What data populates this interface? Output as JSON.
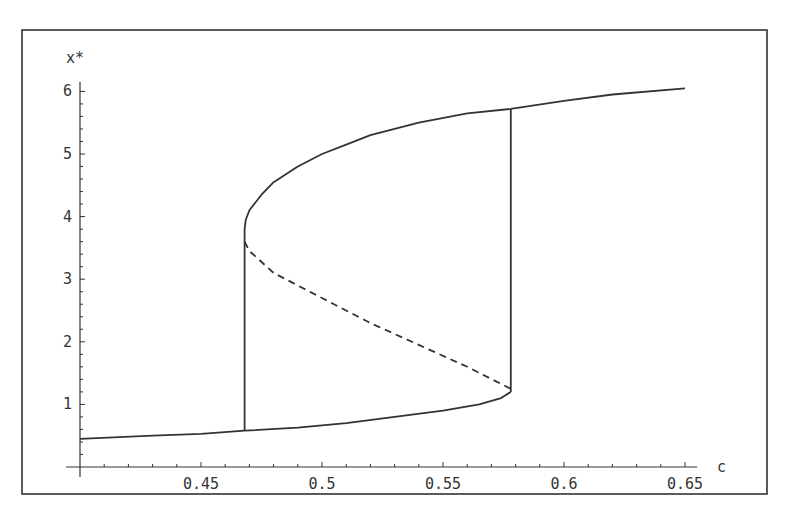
{
  "chart_data": {
    "type": "line",
    "title": "",
    "xlabel": "c",
    "ylabel": "x*",
    "xlim": [
      0.4,
      0.655
    ],
    "ylim": [
      0,
      6.2
    ],
    "grid": false,
    "legend": null,
    "x_ticks": [
      0.45,
      0.5,
      0.55,
      0.6,
      0.65
    ],
    "x_tick_labels": [
      "0.45",
      "0.5",
      "0.55",
      "0.6",
      "0.65"
    ],
    "y_ticks": [
      1,
      2,
      3,
      4,
      5,
      6
    ],
    "y_tick_labels": [
      "1",
      "2",
      "3",
      "4",
      "5",
      "6"
    ],
    "series": [
      {
        "name": "upper stable branch",
        "style": "solid",
        "points": [
          [
            0.468,
            3.8
          ],
          [
            0.4685,
            3.95
          ],
          [
            0.47,
            4.1
          ],
          [
            0.475,
            4.35
          ],
          [
            0.48,
            4.55
          ],
          [
            0.49,
            4.8
          ],
          [
            0.5,
            5.0
          ],
          [
            0.51,
            5.15
          ],
          [
            0.52,
            5.3
          ],
          [
            0.54,
            5.5
          ],
          [
            0.56,
            5.65
          ],
          [
            0.578,
            5.72
          ],
          [
            0.6,
            5.85
          ],
          [
            0.62,
            5.95
          ],
          [
            0.65,
            6.05
          ]
        ]
      },
      {
        "name": "unstable branch",
        "style": "dashed",
        "points": [
          [
            0.468,
            3.6
          ],
          [
            0.47,
            3.45
          ],
          [
            0.48,
            3.1
          ],
          [
            0.49,
            2.9
          ],
          [
            0.5,
            2.7
          ],
          [
            0.52,
            2.3
          ],
          [
            0.54,
            1.95
          ],
          [
            0.56,
            1.6
          ],
          [
            0.578,
            1.25
          ]
        ]
      },
      {
        "name": "lower stable branch",
        "style": "solid",
        "points": [
          [
            0.4,
            0.45
          ],
          [
            0.43,
            0.5
          ],
          [
            0.45,
            0.53
          ],
          [
            0.468,
            0.58
          ],
          [
            0.49,
            0.63
          ],
          [
            0.51,
            0.7
          ],
          [
            0.53,
            0.8
          ],
          [
            0.55,
            0.9
          ],
          [
            0.565,
            1.0
          ],
          [
            0.574,
            1.1
          ],
          [
            0.578,
            1.2
          ]
        ]
      },
      {
        "name": "jump at lower fold",
        "style": "solid",
        "points": [
          [
            0.468,
            0.58
          ],
          [
            0.468,
            3.8
          ]
        ]
      },
      {
        "name": "jump at upper fold",
        "style": "solid",
        "points": [
          [
            0.578,
            1.2
          ],
          [
            0.578,
            5.72
          ]
        ]
      }
    ]
  }
}
